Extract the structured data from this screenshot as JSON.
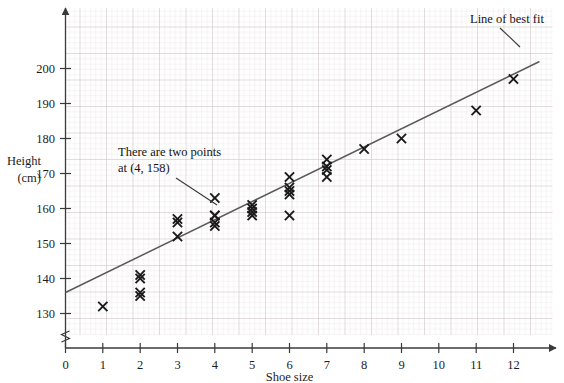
{
  "figure": {
    "name": "scatter-graph-shoe-size-height",
    "background": "#ffffff",
    "grid_minor_color": "#e3dede",
    "grid_major_color": "#cfc8c8",
    "axis_color": "#3a3a3a",
    "marker_color": "#1a1a1a",
    "line_color": "#5a5a5a"
  },
  "axes": {
    "x_title": "Shoe size",
    "y_title_line1": "Height",
    "y_title_line2": "(cm)",
    "x_ticks": [
      "0",
      "1",
      "2",
      "3",
      "4",
      "5",
      "6",
      "7",
      "8",
      "9",
      "10",
      "11",
      "12"
    ],
    "y_ticks": [
      "130",
      "140",
      "150",
      "160",
      "170",
      "180",
      "190",
      "200"
    ],
    "x_range": [
      0,
      13
    ],
    "y_range": [
      125,
      205
    ],
    "y_axis_break": true
  },
  "annotations": [
    {
      "name": "two-points-annotation",
      "line1": "There are two points",
      "line2": "at (4, 158)"
    },
    {
      "name": "line-of-best-fit-annotation",
      "text": "Line of best fit"
    }
  ],
  "chart_data": {
    "type": "scatter",
    "title": "",
    "xlabel": "Shoe size",
    "ylabel": "Height (cm)",
    "xlim": [
      0,
      13
    ],
    "ylim": [
      125,
      205
    ],
    "grid": true,
    "legend": "none",
    "marker": "x",
    "x_tick_values": [
      0,
      1,
      2,
      3,
      4,
      5,
      6,
      7,
      8,
      9,
      10,
      11,
      12
    ],
    "y_tick_values": [
      130,
      140,
      150,
      160,
      170,
      180,
      190,
      200
    ],
    "points": [
      [
        1,
        132
      ],
      [
        2,
        141
      ],
      [
        2,
        140
      ],
      [
        2,
        136
      ],
      [
        2,
        135
      ],
      [
        3,
        157
      ],
      [
        3,
        156
      ],
      [
        3,
        152
      ],
      [
        4,
        163
      ],
      [
        4,
        158
      ],
      [
        4,
        158
      ],
      [
        4,
        156
      ],
      [
        4,
        155
      ],
      [
        5,
        161
      ],
      [
        5,
        160
      ],
      [
        5,
        159
      ],
      [
        5,
        158
      ],
      [
        6,
        169
      ],
      [
        6,
        166
      ],
      [
        6,
        165
      ],
      [
        6,
        164
      ],
      [
        6,
        158
      ],
      [
        7,
        174
      ],
      [
        7,
        172
      ],
      [
        7,
        171
      ],
      [
        7,
        169
      ],
      [
        8,
        177
      ],
      [
        9,
        180
      ],
      [
        11,
        188
      ],
      [
        12,
        197
      ]
    ],
    "line_of_best_fit": {
      "label": "Line of best fit",
      "x_start": 0,
      "y_start": 136,
      "x_end": 12.7,
      "y_end": 202
    },
    "notes": [
      "There are two points at (4, 158)"
    ]
  }
}
